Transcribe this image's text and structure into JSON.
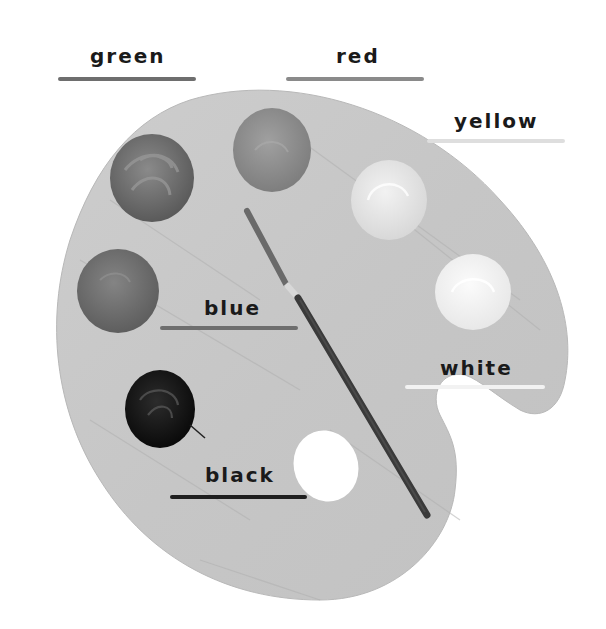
{
  "worksheet": {
    "title": "Paint palette color labels",
    "labels": [
      {
        "id": "green",
        "text": "green"
      },
      {
        "id": "red",
        "text": "red"
      },
      {
        "id": "yellow",
        "text": "yellow"
      },
      {
        "id": "blue",
        "text": "blue"
      },
      {
        "id": "white",
        "text": "white"
      },
      {
        "id": "black",
        "text": "black"
      }
    ],
    "paint_blobs": [
      {
        "name": "green-paint",
        "color": "#6a6a6a"
      },
      {
        "name": "red-paint",
        "color": "#8c8c8c"
      },
      {
        "name": "yellow-paint",
        "color": "#e4e4e4"
      },
      {
        "name": "white-paint",
        "color": "#f4f4f4"
      },
      {
        "name": "blue-paint",
        "color": "#707070"
      },
      {
        "name": "black-paint",
        "color": "#141414"
      }
    ],
    "colors": {
      "palette": "#c9c9c9",
      "palette_edge": "#bdbdbd",
      "label_text": "#1a1a1a",
      "underline_green": "#6e6e6e",
      "underline_red": "#8a8a8a",
      "underline_yellow": "#dedede",
      "underline_blue": "#6e6e6e",
      "underline_white": "#f2f2f2",
      "underline_black": "#1f1f1f"
    }
  }
}
